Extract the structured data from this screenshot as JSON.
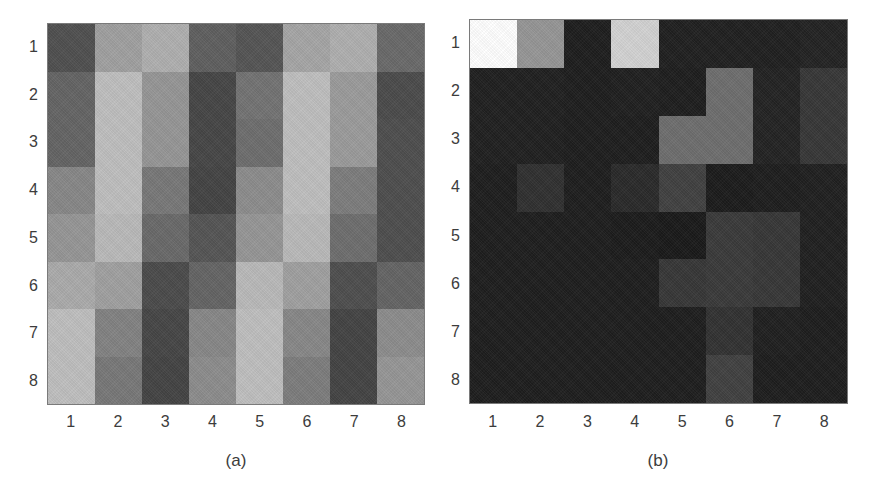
{
  "chart_data": [
    {
      "type": "heatmap",
      "title": "",
      "caption": "(a)",
      "colormap": "gray",
      "xlabel": "",
      "ylabel": "",
      "x_ticks": [
        "1",
        "2",
        "3",
        "4",
        "5",
        "6",
        "7",
        "8"
      ],
      "y_ticks": [
        "1",
        "2",
        "3",
        "4",
        "5",
        "6",
        "7",
        "8"
      ],
      "y_axis_direction": "top-to-bottom",
      "grid": false,
      "values_gray_0_255": [
        [
          80,
          160,
          175,
          95,
          85,
          165,
          175,
          105
        ],
        [
          100,
          190,
          150,
          70,
          115,
          190,
          155,
          75
        ],
        [
          100,
          190,
          150,
          70,
          110,
          190,
          155,
          78
        ],
        [
          135,
          190,
          120,
          68,
          140,
          190,
          125,
          78
        ],
        [
          150,
          185,
          105,
          85,
          150,
          185,
          110,
          78
        ],
        [
          170,
          160,
          75,
          100,
          185,
          160,
          78,
          100
        ],
        [
          190,
          130,
          70,
          135,
          190,
          135,
          68,
          140
        ],
        [
          190,
          120,
          68,
          140,
          190,
          125,
          68,
          150
        ]
      ]
    },
    {
      "type": "heatmap",
      "title": "",
      "caption": "(b)",
      "colormap": "gray",
      "xlabel": "",
      "ylabel": "",
      "x_ticks": [
        "1",
        "2",
        "3",
        "4",
        "5",
        "6",
        "7",
        "8"
      ],
      "y_ticks": [
        "1",
        "2",
        "3",
        "4",
        "5",
        "6",
        "7",
        "8"
      ],
      "y_axis_direction": "top-to-bottom",
      "grid": false,
      "values_gray_0_255": [
        [
          255,
          150,
          30,
          210,
          32,
          32,
          32,
          35
        ],
        [
          32,
          32,
          30,
          32,
          30,
          110,
          35,
          55
        ],
        [
          32,
          32,
          30,
          30,
          110,
          110,
          35,
          55
        ],
        [
          30,
          48,
          30,
          42,
          65,
          28,
          30,
          32
        ],
        [
          30,
          30,
          30,
          28,
          26,
          58,
          55,
          32
        ],
        [
          30,
          30,
          30,
          30,
          55,
          58,
          55,
          32
        ],
        [
          30,
          30,
          30,
          30,
          30,
          50,
          32,
          30
        ],
        [
          30,
          30,
          30,
          30,
          30,
          65,
          30,
          30
        ]
      ]
    }
  ],
  "panels": [
    {
      "caption": "(a)",
      "x_ticks": [
        "1",
        "2",
        "3",
        "4",
        "5",
        "6",
        "7",
        "8"
      ],
      "y_ticks": [
        "1",
        "2",
        "3",
        "4",
        "5",
        "6",
        "7",
        "8"
      ]
    },
    {
      "caption": "(b)",
      "x_ticks": [
        "1",
        "2",
        "3",
        "4",
        "5",
        "6",
        "7",
        "8"
      ],
      "y_ticks": [
        "1",
        "2",
        "3",
        "4",
        "5",
        "6",
        "7",
        "8"
      ]
    }
  ]
}
